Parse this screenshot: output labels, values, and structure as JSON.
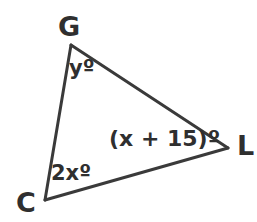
{
  "figure": {
    "type": "triangle-angle-diagram",
    "background_color": "#ffffff",
    "stroke_color": "#3a3a3a",
    "text_color": "#2f2f2f",
    "stroke_width": 3,
    "vertices": [
      {
        "name": "G",
        "label": "G",
        "x": 71,
        "y": 45,
        "label_x": 58,
        "label_y": 13
      },
      {
        "name": "C",
        "label": "C",
        "x": 45,
        "y": 200,
        "label_x": 16,
        "label_y": 189
      },
      {
        "name": "L",
        "label": "L",
        "x": 228,
        "y": 148,
        "label_x": 237,
        "label_y": 132
      }
    ],
    "edges": [
      {
        "name": "edge-G-L",
        "from": "G",
        "to": "L"
      },
      {
        "name": "edge-G-C",
        "from": "G",
        "to": "C"
      },
      {
        "name": "edge-C-L",
        "from": "C",
        "to": "L"
      }
    ],
    "angles": [
      {
        "at": "G",
        "label": "yº",
        "expression": "y",
        "x": 69,
        "y": 58
      },
      {
        "at": "C",
        "label": "2xº",
        "expression": "2x",
        "x": 51,
        "y": 163
      },
      {
        "at": "L",
        "label": "(x + 15)º",
        "expression": "x + 15",
        "x": 109,
        "y": 128
      }
    ]
  }
}
